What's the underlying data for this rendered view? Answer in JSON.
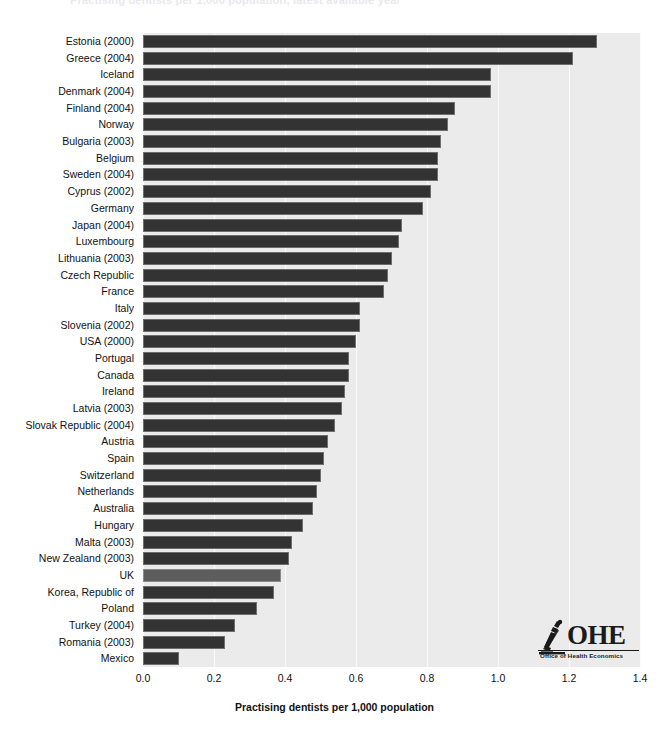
{
  "chart_data": {
    "type": "bar",
    "orientation": "horizontal",
    "title": "Practising dentists per 1,000 population, latest available year",
    "xlabel": "Practising dentists per 1,000 population",
    "ylabel": "",
    "xlim": [
      0.0,
      1.4
    ],
    "xticks": [
      "0.0",
      "0.2",
      "0.4",
      "0.6",
      "0.8",
      "1.0",
      "1.2",
      "1.4"
    ],
    "xtick_values": [
      0.0,
      0.2,
      0.4,
      0.6,
      0.8,
      1.0,
      1.2,
      1.4
    ],
    "grid": true,
    "grid_axis": "x",
    "legend": "none",
    "highlight_category": "UK",
    "bar_color": "#333333",
    "highlight_color": "#5d5d5d",
    "panel_color": "#ebebeb",
    "categories": [
      "Estonia (2000)",
      "Greece (2004)",
      "Iceland",
      "Denmark (2004)",
      "Finland (2004)",
      "Norway",
      "Bulgaria (2003)",
      "Belgium",
      "Sweden (2004)",
      "Cyprus (2002)",
      "Germany",
      "Japan (2004)",
      "Luxembourg",
      "Lithuania (2003)",
      "Czech Republic",
      "France",
      "Italy",
      "Slovenia (2002)",
      "USA (2000)",
      "Portugal",
      "Canada",
      "Ireland",
      "Latvia (2003)",
      "Slovak Republic (2004)",
      "Austria",
      "Spain",
      "Switzerland",
      "Netherlands",
      "Australia",
      "Hungary",
      "Malta (2003)",
      "New Zealand (2003)",
      "UK",
      "Korea, Republic of",
      "Poland",
      "Turkey (2004)",
      "Romania (2003)",
      "Mexico"
    ],
    "values": [
      1.28,
      1.21,
      0.98,
      0.98,
      0.88,
      0.86,
      0.84,
      0.83,
      0.83,
      0.81,
      0.79,
      0.73,
      0.72,
      0.7,
      0.69,
      0.68,
      0.61,
      0.61,
      0.6,
      0.58,
      0.58,
      0.57,
      0.56,
      0.54,
      0.52,
      0.51,
      0.5,
      0.49,
      0.48,
      0.45,
      0.42,
      0.41,
      0.39,
      0.37,
      0.32,
      0.26,
      0.23,
      0.1
    ]
  },
  "logo": {
    "word": "OHE",
    "subtitle": "Office of Health Economics",
    "mark": "microscope-icon"
  }
}
